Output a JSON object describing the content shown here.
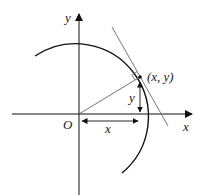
{
  "diagram": {
    "labels": {
      "y_axis": "y",
      "x_axis": "x",
      "origin": "O",
      "point": "(x, y)",
      "horizontal_distance": "x",
      "vertical_distance": "y"
    },
    "colors": {
      "axis": "#111111",
      "circle": "#111111",
      "tangent": "#777777",
      "radius": "#666666"
    }
  }
}
